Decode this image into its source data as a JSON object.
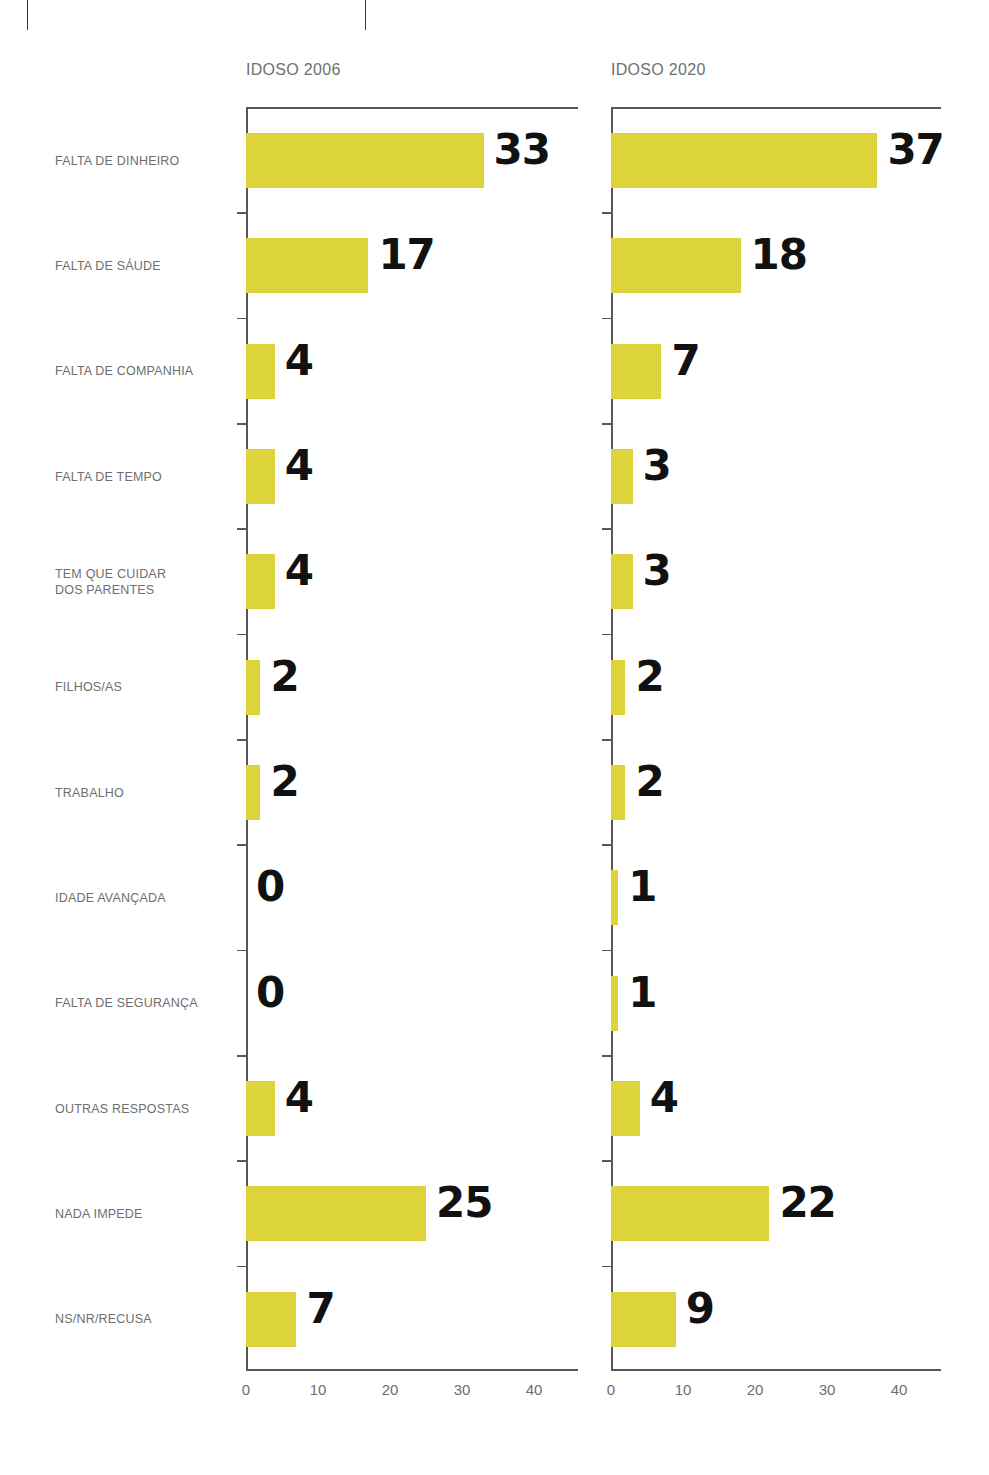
{
  "crop_marks": [
    "crop-mark-left",
    "crop-mark-right"
  ],
  "panels": [
    {
      "id": "panel-2006",
      "title": "IDOSO 2006"
    },
    {
      "id": "panel-2020",
      "title": "IDOSO 2020"
    }
  ],
  "axis": {
    "ticks": [
      "0",
      "10",
      "20",
      "30",
      "40"
    ],
    "tick_values": [
      0,
      10,
      20,
      30,
      40
    ]
  },
  "colors": {
    "bar": "#ddd43c",
    "axis": "#58585a",
    "label_text": "#6e6e6e",
    "value_text": "#111111",
    "background": "#ffffff"
  },
  "chart_data": {
    "type": "bar",
    "orientation": "horizontal",
    "title": "",
    "xlabel": "",
    "ylabel": "",
    "xlim": [
      0,
      45
    ],
    "grid": false,
    "legend": "none",
    "categories": [
      "FALTA DE DINHEIRO",
      "FALTA DE SÁUDE",
      "FALTA DE COMPANHIA",
      "FALTA DE TEMPO",
      "TEM QUE CUIDAR\nDOS PARENTES",
      "FILHOS/AS",
      "TRABALHO",
      "IDADE AVANÇADA",
      "FALTA DE SEGURANÇA",
      "OUTRAS RESPOSTAS",
      "NADA IMPEDE",
      "NS/NR/RECUSA"
    ],
    "series": [
      {
        "name": "IDOSO 2006",
        "values": [
          33,
          17,
          4,
          4,
          4,
          2,
          2,
          0,
          0,
          4,
          25,
          7
        ],
        "labels": [
          "33",
          "17",
          "4",
          "4",
          "4",
          "2",
          "2",
          "0",
          "0",
          "4",
          "25",
          "7"
        ]
      },
      {
        "name": "IDOSO 2020",
        "values": [
          37,
          18,
          7,
          3,
          3,
          2,
          2,
          1,
          1,
          4,
          22,
          9
        ],
        "labels": [
          "37",
          "18",
          "7",
          "3",
          "3",
          "2",
          "2",
          "1",
          "1",
          "4",
          "22",
          "9"
        ]
      }
    ]
  }
}
